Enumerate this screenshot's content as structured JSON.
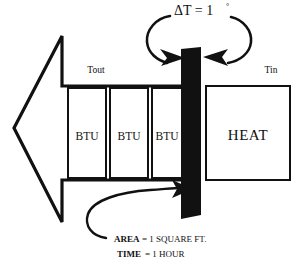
{
  "diagram": {
    "title_label": "ΔT = 1",
    "title_degree": "°",
    "left_label": "Tout",
    "right_label": "Tin",
    "heat_label": "HEAT",
    "btu_boxes": [
      {
        "label": "BTU"
      },
      {
        "label": "BTU"
      },
      {
        "label": "BTU"
      }
    ],
    "notes": [
      {
        "term": "AREA",
        "value": "= 1 SQUARE FT."
      },
      {
        "term": "TIME",
        "value": "= 1 HOUR"
      }
    ],
    "colors": {
      "ink": "#111111",
      "background": "#ffffff",
      "wall": "#111111"
    },
    "icons": {
      "flow_arrow": "left-arrow-icon",
      "wall": "wall-bar-icon",
      "delta_loop": "temperature-loop-icon",
      "area_pointer": "curved-arrow-icon"
    }
  }
}
